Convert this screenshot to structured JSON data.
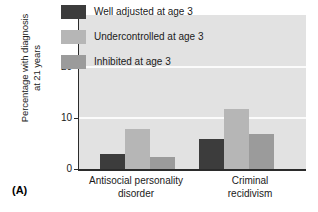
{
  "panel": {
    "caption": "(A)"
  },
  "chart_data": {
    "type": "bar",
    "title": "",
    "subtitle": "",
    "xlabel": "",
    "ylabel": "Percentage with diagnosis\nat 21 years",
    "ylim": [
      0,
      30
    ],
    "yticks": [
      0,
      10,
      20,
      30
    ],
    "ytick_labels": [
      "0",
      "10",
      "20",
      "30"
    ],
    "grid": true,
    "grid_values": [
      10,
      20
    ],
    "legend_position": "top-center",
    "categories": [
      "Antisocial personality\ndisorder",
      "Criminal\nrecidivism"
    ],
    "series": [
      {
        "name": "Well adjusted at age 3",
        "color": "#3c3c3c",
        "values": [
          3.0,
          5.9
        ]
      },
      {
        "name": "Undercontrolled at age 3",
        "color": "#b6b6b6",
        "values": [
          7.7,
          11.6
        ]
      },
      {
        "name": "Inhibited at age 3",
        "color": "#9b9b9b",
        "values": [
          2.4,
          6.9
        ]
      }
    ]
  },
  "axis": {
    "tick_30": "30",
    "tick_20": "20",
    "tick_10": "10",
    "tick_0": "0"
  },
  "legend": {
    "items": [
      {
        "label": "Well adjusted at age 3",
        "color": "#3c3c3c"
      },
      {
        "label": "Undercontrolled at age 3",
        "color": "#b6b6b6"
      },
      {
        "label": "Inhibited at age 3",
        "color": "#9b9b9b"
      }
    ]
  }
}
